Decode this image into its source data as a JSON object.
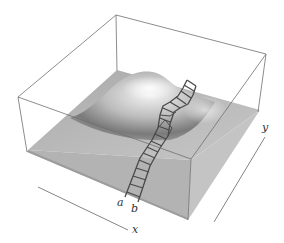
{
  "figure": {
    "labels": {
      "a": "a",
      "b": "b",
      "x_axis": "x",
      "y_axis": "y"
    },
    "colors": {
      "box_edge": "#6a6a6a",
      "surface_light": "#e8e8e8",
      "surface_mid": "#b8b8b8",
      "surface_dark": "#6e6e6e",
      "ribbon": "#4a4a4a"
    }
  }
}
